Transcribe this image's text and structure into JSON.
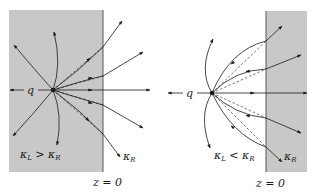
{
  "figure": {
    "colors": {
      "dielectric": "#c8c8c8",
      "line": "#1a1a1a",
      "background": "#ffffff"
    },
    "panels": [
      {
        "id": "left",
        "charge_label": "q",
        "condition_label": "κL > κR",
        "condition": {
          "k1": "κ",
          "s1": "L",
          "op": " > ",
          "k2": "κ",
          "s2": "R"
        },
        "region_label": {
          "k": "κ",
          "s": "R"
        },
        "interface_label": "z = 0",
        "shaded_side": "left"
      },
      {
        "id": "right",
        "charge_label": "q",
        "condition_label": "κL < κR",
        "condition": {
          "k1": "κ",
          "s1": "L",
          "op": " < ",
          "k2": "κ",
          "s2": "R"
        },
        "region_label": {
          "k": "κ",
          "s": "R"
        },
        "interface_label": "z = 0",
        "shaded_side": "right"
      }
    ]
  }
}
